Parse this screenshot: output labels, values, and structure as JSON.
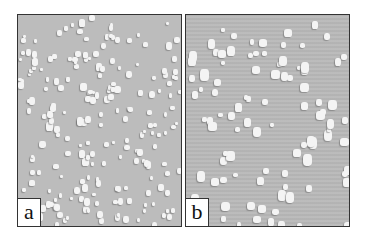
{
  "figure": {
    "panels": [
      {
        "id": "a",
        "label": "a",
        "description": "Grey surface with dense small white particles"
      },
      {
        "id": "b",
        "label": "b",
        "description": "Grey surface with sparser, larger white particles"
      }
    ]
  },
  "colors": {
    "background": "#ffffff",
    "panel_a_surface": "#bcbcbc",
    "panel_b_surface": "#b9b9b9",
    "particle": "#f4f4f4",
    "border": "#333333"
  }
}
